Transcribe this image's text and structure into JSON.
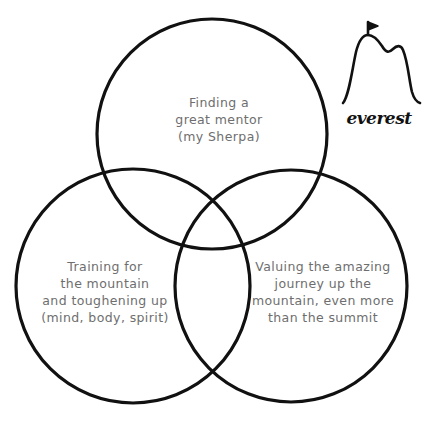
{
  "diagram": {
    "type": "venn",
    "stroke_color": "#111111",
    "text_color": "#6e6e6e",
    "background": "#ffffff",
    "circles": [
      {
        "id": "top",
        "cx": 212,
        "cy": 134,
        "r": 115,
        "lines": [
          "Finding a",
          "great mentor",
          "(my Sherpa)"
        ]
      },
      {
        "id": "left",
        "cx": 133,
        "cy": 286,
        "r": 117,
        "lines": [
          "Training for",
          "the mountain",
          "and toughening up",
          "(mind, body, spirit)"
        ]
      },
      {
        "id": "right",
        "cx": 291,
        "cy": 286,
        "r": 116,
        "lines": [
          "Valuing the amazing",
          "journey up the",
          "mountain, even more",
          "than the summit"
        ]
      }
    ]
  },
  "logo": {
    "icon": "mountain-with-flag-icon",
    "text": "everest"
  }
}
